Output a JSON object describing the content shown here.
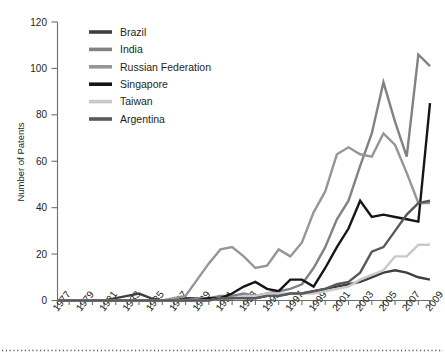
{
  "chart_data": {
    "type": "line",
    "title": "",
    "xlabel": "",
    "ylabel": "Number of Patents",
    "ylim": [
      0,
      120
    ],
    "ytick_step": 20,
    "yticks": [
      0,
      20,
      40,
      60,
      80,
      100,
      120
    ],
    "xlim": [
      1977,
      2009
    ],
    "grid": false,
    "legend_position": "upper-left-inset",
    "x": [
      1977,
      1978,
      1979,
      1980,
      1981,
      1982,
      1983,
      1984,
      1985,
      1986,
      1987,
      1988,
      1989,
      1990,
      1991,
      1992,
      1993,
      1994,
      1995,
      1996,
      1997,
      1998,
      1999,
      2000,
      2001,
      2002,
      2003,
      2004,
      2005,
      2006,
      2007,
      2008,
      2009
    ],
    "xtick_labels": [
      "1977",
      "1979",
      "1981",
      "1983",
      "1985",
      "1987",
      "1989",
      "1991",
      "1993",
      "1995",
      "1997",
      "1999",
      "2001",
      "2003",
      "2005",
      "2007",
      "2009"
    ],
    "xtick_values": [
      1977,
      1979,
      1981,
      1983,
      1985,
      1987,
      1989,
      1991,
      1993,
      1995,
      1997,
      1999,
      2001,
      2003,
      2005,
      2007,
      2009
    ],
    "series": [
      {
        "name": "Brazil",
        "color": "#3f3f41",
        "width": 2.4,
        "values": [
          0,
          0,
          0,
          0,
          0,
          1,
          2,
          3,
          1,
          0,
          0,
          1,
          1,
          1,
          1,
          1,
          2,
          1,
          2,
          2,
          3,
          3,
          4,
          5,
          6,
          7,
          8,
          10,
          12,
          13,
          12,
          10,
          9
        ]
      },
      {
        "name": "India",
        "color": "#808285",
        "width": 2.4,
        "values": [
          0,
          0,
          0,
          0,
          0,
          0,
          0,
          0,
          0,
          0,
          0,
          0,
          1,
          1,
          2,
          2,
          3,
          2,
          3,
          4,
          5,
          7,
          14,
          23,
          35,
          43,
          58,
          72,
          94,
          77,
          62,
          106,
          101
        ]
      },
      {
        "name": "Russian Federation",
        "color": "#949699",
        "width": 2.4,
        "values": [
          0,
          0,
          0,
          0,
          0,
          0,
          0,
          0,
          0,
          0,
          1,
          2,
          9,
          16,
          22,
          23,
          19,
          14,
          15,
          22,
          19,
          25,
          38,
          47,
          63,
          66,
          63,
          62,
          72,
          67,
          55,
          42,
          42
        ]
      },
      {
        "name": "Singapore",
        "color": "#161617",
        "width": 2.4,
        "values": [
          0,
          0,
          0,
          0,
          0,
          0,
          0,
          0,
          0,
          0,
          0,
          0,
          0,
          1,
          1,
          3,
          6,
          8,
          5,
          4,
          9,
          9,
          6,
          14,
          23,
          31,
          43,
          36,
          37,
          36,
          35,
          34,
          85
        ]
      },
      {
        "name": "Taiwan",
        "color": "#c8c9cb",
        "width": 2.4,
        "values": [
          0,
          0,
          0,
          0,
          0,
          0,
          0,
          0,
          0,
          0,
          0,
          0,
          0,
          0,
          1,
          1,
          2,
          2,
          3,
          3,
          3,
          3,
          3,
          4,
          5,
          6,
          9,
          11,
          13,
          19,
          19,
          24,
          24
        ]
      },
      {
        "name": "Argentina",
        "color": "#58595b",
        "width": 2.4,
        "values": [
          0,
          0,
          0,
          0,
          0,
          0,
          0,
          0,
          0,
          0,
          0,
          0,
          0,
          0,
          1,
          1,
          1,
          1,
          2,
          2,
          3,
          3,
          4,
          5,
          7,
          8,
          12,
          21,
          23,
          30,
          37,
          42,
          43
        ]
      }
    ]
  },
  "legend": {
    "items": [
      {
        "label": "Brazil"
      },
      {
        "label": "India"
      },
      {
        "label": "Russian Federation"
      },
      {
        "label": "Singapore"
      },
      {
        "label": "Taiwan"
      },
      {
        "label": "Argentina"
      }
    ]
  },
  "axes": {
    "y_title": "Number of Patents"
  },
  "footer": {
    "divider": "dotted-rule"
  }
}
